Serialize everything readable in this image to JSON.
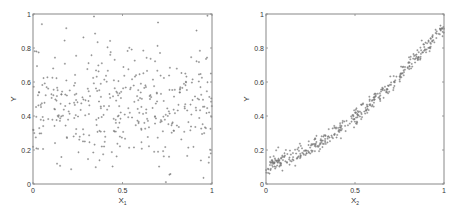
{
  "chart_data": [
    {
      "type": "scatter",
      "title": "",
      "xlabel": "X1",
      "xlabel_main": "X",
      "xlabel_sub": "1",
      "ylabel": "Y",
      "xlim": [
        0,
        1
      ],
      "ylim": [
        0,
        1
      ],
      "xticks": [
        "0",
        "0.5",
        "1"
      ],
      "yticks": [
        "0",
        "0.2",
        "0.4",
        "0.6",
        "0.8",
        "1"
      ],
      "grid": false,
      "marker_color": "#777777",
      "description": "Uniform random scatter, no visible relationship; Y mostly between 0.1 and 0.85, centered ~0.45",
      "generator": {
        "kind": "noise",
        "n": 420,
        "center": 0.46,
        "spread": 0.17,
        "seed": 7
      }
    },
    {
      "type": "scatter",
      "title": "",
      "xlabel": "X2",
      "xlabel_main": "X",
      "xlabel_sub": "2",
      "ylabel": "Y",
      "xlim": [
        0,
        1
      ],
      "ylim": [
        0,
        1
      ],
      "xticks": [
        "0",
        "0.5",
        "1"
      ],
      "yticks": [
        "0",
        "0.2",
        "0.4",
        "0.6",
        "0.8",
        "1"
      ],
      "grid": false,
      "marker_color": "#777777",
      "description": "Tight convex increasing curve: Y ≈ 0.1 + 0.35·X + 0.48·X² (≈0.10 at X=0, ≈0.40 at X=0.5, ≈0.93 at X=1)",
      "curve_samples": {
        "x": [
          0,
          0.25,
          0.5,
          0.75,
          1
        ],
        "y": [
          0.1,
          0.22,
          0.4,
          0.63,
          0.93
        ]
      },
      "generator": {
        "kind": "curve",
        "n": 420,
        "a": 0.1,
        "b": 0.35,
        "c": 0.48,
        "noise": 0.025,
        "seed": 11
      }
    }
  ]
}
